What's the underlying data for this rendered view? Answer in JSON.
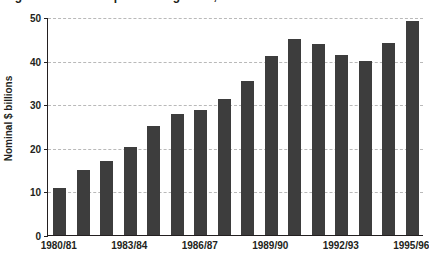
{
  "figure": {
    "title_partial": "Figure: Nominal expenditure growth, 1980/81 to 1995/96",
    "background_color": "#ffffff",
    "bar_color": "#3d3d3d",
    "gridline_color": "#b9b9b9",
    "axis_color": "#231f20"
  },
  "chart_data": {
    "type": "bar",
    "title": "",
    "xlabel": "",
    "ylabel": "Nominal $ billions",
    "ylim": [
      0,
      50
    ],
    "yticks": [
      0,
      10,
      20,
      30,
      40,
      50
    ],
    "ytick_labels": [
      "0",
      "10",
      "20",
      "30",
      "40",
      "50"
    ],
    "grid": true,
    "grid_axis": "y",
    "grid_style": "dashed",
    "legend": false,
    "legend_position": "none",
    "categories": [
      "1980/81",
      "1981/82",
      "1982/83",
      "1983/84",
      "1984/85",
      "1985/86",
      "1986/87",
      "1987/88",
      "1988/89",
      "1989/90",
      "1990/91",
      "1991/92",
      "1992/93",
      "1993/94",
      "1994/95",
      "1995/96"
    ],
    "visible_xtick_labels": [
      "1980/81",
      "1983/84",
      "1986/87",
      "1989/90",
      "1992/93",
      "1995/96"
    ],
    "visible_xtick_indices": [
      0,
      3,
      6,
      9,
      12,
      15
    ],
    "values": [
      10.7,
      15.0,
      16.9,
      20.3,
      24.9,
      27.8,
      28.7,
      31.2,
      35.4,
      41.1,
      44.9,
      43.8,
      41.2,
      40.0,
      44.1,
      49.2
    ]
  }
}
